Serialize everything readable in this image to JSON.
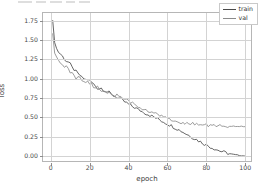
{
  "figure": {
    "background": "#ffffff",
    "toolbar_ghost_visible": true
  },
  "chart_data": {
    "type": "line",
    "title": "",
    "xlabel": "epoch",
    "ylabel": "loss",
    "xlim": [
      -4,
      104
    ],
    "ylim": [
      -0.09,
      1.85
    ],
    "xticks": [
      0,
      20,
      40,
      60,
      80,
      100
    ],
    "xtick_labels": [
      "0",
      "20",
      "40",
      "60",
      "80",
      "100"
    ],
    "yticks": [
      0.0,
      0.25,
      0.5,
      0.75,
      1.0,
      1.25,
      1.5,
      1.75
    ],
    "ytick_labels": [
      "0.00",
      "0.25",
      "0.50",
      "0.75",
      "1.00",
      "1.25",
      "1.50",
      "1.75"
    ],
    "grid": true,
    "grid_color": "#d3d3d3",
    "legend_position": "upper right",
    "legend": [
      "train",
      "val"
    ],
    "x": [
      1,
      2,
      3,
      4,
      5,
      6,
      7,
      8,
      9,
      10,
      11,
      12,
      13,
      14,
      15,
      16,
      17,
      18,
      19,
      20,
      21,
      22,
      23,
      24,
      25,
      26,
      27,
      28,
      29,
      30,
      31,
      32,
      33,
      34,
      35,
      36,
      37,
      38,
      39,
      40,
      41,
      42,
      43,
      44,
      45,
      46,
      47,
      48,
      49,
      50,
      51,
      52,
      53,
      54,
      55,
      56,
      57,
      58,
      59,
      60,
      61,
      62,
      63,
      64,
      65,
      66,
      67,
      68,
      69,
      70,
      71,
      72,
      73,
      74,
      75,
      76,
      77,
      78,
      79,
      80,
      81,
      82,
      83,
      84,
      85,
      86,
      87,
      88,
      89,
      90,
      91,
      92,
      93,
      94,
      95,
      96,
      97,
      98,
      99,
      100
    ],
    "series": [
      {
        "name": "train",
        "color": "#4a4a4a",
        "values": [
          1.75,
          1.47,
          1.39,
          1.345,
          1.32,
          1.29,
          1.258,
          1.23,
          1.215,
          1.185,
          1.14,
          1.12,
          1.09,
          1.06,
          1.045,
          1.01,
          1.0,
          0.985,
          0.995,
          0.975,
          0.95,
          0.93,
          0.905,
          0.88,
          0.875,
          0.88,
          0.86,
          0.845,
          0.83,
          0.82,
          0.8,
          0.79,
          0.775,
          0.76,
          0.745,
          0.73,
          0.715,
          0.7,
          0.685,
          0.67,
          0.655,
          0.64,
          0.63,
          0.615,
          0.6,
          0.59,
          0.575,
          0.565,
          0.55,
          0.54,
          0.528,
          0.515,
          0.505,
          0.492,
          0.48,
          0.468,
          0.455,
          0.443,
          0.43,
          0.418,
          0.405,
          0.392,
          0.378,
          0.365,
          0.352,
          0.338,
          0.325,
          0.31,
          0.296,
          0.282,
          0.268,
          0.254,
          0.24,
          0.226,
          0.212,
          0.198,
          0.184,
          0.17,
          0.157,
          0.144,
          0.131,
          0.119,
          0.108,
          0.097,
          0.086,
          0.076,
          0.067,
          0.058,
          0.05,
          0.043,
          0.036,
          0.03,
          0.025,
          0.02,
          0.016,
          0.012,
          0.009,
          0.006,
          0.003,
          0.001
        ]
      },
      {
        "name": "val",
        "color": "#8a8a8a",
        "values": [
          1.58,
          1.33,
          1.28,
          1.24,
          1.2,
          1.175,
          1.16,
          1.15,
          1.125,
          1.09,
          1.06,
          1.03,
          1.015,
          1.02,
          1.005,
          0.99,
          0.975,
          0.96,
          0.95,
          0.935,
          0.92,
          0.9,
          0.885,
          0.895,
          0.87,
          0.855,
          0.845,
          0.835,
          0.82,
          0.81,
          0.8,
          0.785,
          0.775,
          0.79,
          0.765,
          0.75,
          0.735,
          0.74,
          0.72,
          0.705,
          0.695,
          0.68,
          0.668,
          0.655,
          0.645,
          0.632,
          0.62,
          0.61,
          0.598,
          0.588,
          0.578,
          0.566,
          0.556,
          0.546,
          0.537,
          0.528,
          0.518,
          0.51,
          0.5,
          0.492,
          0.484,
          0.476,
          0.468,
          0.46,
          0.452,
          0.445,
          0.44,
          0.434,
          0.43,
          0.426,
          0.422,
          0.418,
          0.416,
          0.413,
          0.41,
          0.408,
          0.406,
          0.404,
          0.402,
          0.4,
          0.398,
          0.397,
          0.396,
          0.394,
          0.393,
          0.392,
          0.391,
          0.39,
          0.389,
          0.388,
          0.387,
          0.387,
          0.386,
          0.386,
          0.385,
          0.385,
          0.384,
          0.384,
          0.383,
          0.383
        ]
      }
    ],
    "noise_amplitude": 0.022
  }
}
